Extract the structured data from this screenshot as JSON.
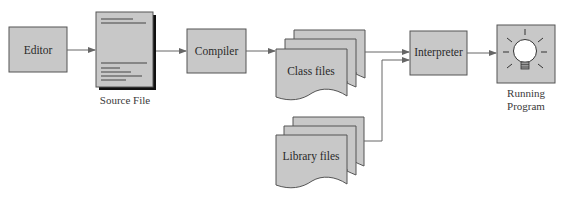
{
  "diagram": {
    "type": "flowchart",
    "colors": {
      "box_fill": "#c8c8c8",
      "box_stroke": "#555555",
      "arrow": "#666666",
      "shadow": "#111111",
      "bulb": "#ffffff"
    },
    "nodes": {
      "editor": {
        "label": "Editor"
      },
      "source_file": {
        "label": "",
        "caption": "Source File"
      },
      "compiler": {
        "label": "Compiler"
      },
      "class_files": {
        "label": "Class files"
      },
      "library_files": {
        "label": "Library files"
      },
      "interpreter": {
        "label": "Interpreter"
      },
      "running_program": {
        "label": "",
        "caption_line1": "Running",
        "caption_line2": "Program",
        "icon": "lightbulb-icon"
      }
    },
    "edges": [
      {
        "from": "Editor",
        "to": "Source File"
      },
      {
        "from": "Source File",
        "to": "Compiler"
      },
      {
        "from": "Compiler",
        "to": "Class files"
      },
      {
        "from": "Class files",
        "to": "Interpreter"
      },
      {
        "from": "Library files",
        "to": "Interpreter"
      },
      {
        "from": "Interpreter",
        "to": "Running Program"
      }
    ]
  }
}
